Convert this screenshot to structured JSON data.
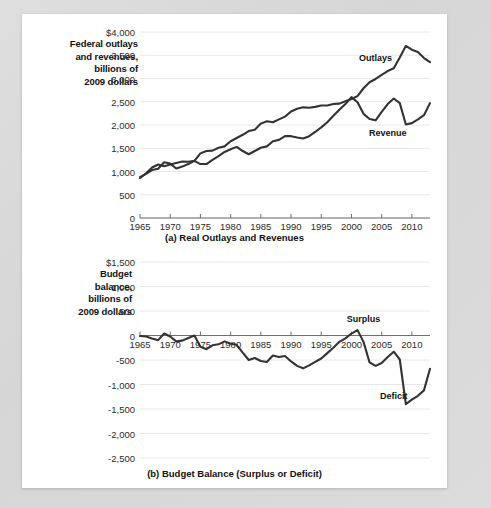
{
  "figure": {
    "background_color": "#d9d9d9",
    "card_color": "#ffffff",
    "line_color": "#333333"
  },
  "panel_a": {
    "axis_title": "Federal outlays and revenues, billions of 2009 dollars",
    "axis_title_lines": [
      "Federal outlays",
      "and revenues,",
      "billions of",
      "2009 dollars"
    ],
    "caption": "(a) Real Outlays and Revenues",
    "series_labels": [
      {
        "name": "outlays-label",
        "text": "Outlays"
      },
      {
        "name": "revenue-label",
        "text": "Revenue"
      }
    ]
  },
  "panel_b": {
    "axis_title": "Budget balance, billions of 2009 dollars",
    "axis_title_lines": [
      "Budget",
      "balance,",
      "billions of",
      "2009 dollars"
    ],
    "caption": "(b) Budget Balance (Surplus or Deficit)",
    "series_labels": [
      {
        "name": "surplus-label",
        "text": "Surplus"
      },
      {
        "name": "deficit-label",
        "text": "Deficit"
      }
    ]
  },
  "chart_data": [
    {
      "id": "real-outlays-and-revenues",
      "type": "line",
      "title": "(a) Real Outlays and Revenues",
      "xlabel": "",
      "ylabel": "Federal outlays and revenues, billions of 2009 dollars",
      "xlim": [
        1965,
        2013
      ],
      "ylim": [
        0,
        4000
      ],
      "grid": true,
      "yticks": [
        0,
        500,
        1000,
        1500,
        2000,
        2500,
        3000,
        3500,
        4000
      ],
      "ytick_labels": [
        "0",
        "500",
        "1,000",
        "1,500",
        "2,000",
        "2,500",
        "3,000",
        "3,500",
        "$4,000"
      ],
      "xticks": [
        1965,
        1970,
        1975,
        1980,
        1985,
        1990,
        1995,
        2000,
        2005,
        2010
      ],
      "xtick_labels": [
        "1965",
        "1970",
        "1975",
        "1980",
        "1985",
        "1990",
        "1995",
        "2000",
        "2005",
        "2010"
      ],
      "x": [
        1965,
        1966,
        1967,
        1968,
        1969,
        1970,
        1971,
        1972,
        1973,
        1974,
        1975,
        1976,
        1977,
        1978,
        1979,
        1980,
        1981,
        1982,
        1983,
        1984,
        1985,
        1986,
        1987,
        1988,
        1989,
        1990,
        1991,
        1992,
        1993,
        1994,
        1995,
        1996,
        1997,
        1998,
        1999,
        2000,
        2001,
        2002,
        2003,
        2004,
        2005,
        2006,
        2007,
        2008,
        2009,
        2010,
        2011,
        2012,
        2013
      ],
      "series": [
        {
          "name": "Outlays",
          "values": [
            860,
            960,
            1085,
            1150,
            1115,
            1150,
            1185,
            1215,
            1210,
            1230,
            1390,
            1440,
            1450,
            1510,
            1540,
            1650,
            1720,
            1790,
            1870,
            1900,
            2030,
            2080,
            2060,
            2120,
            2180,
            2290,
            2350,
            2380,
            2370,
            2390,
            2420,
            2420,
            2450,
            2460,
            2510,
            2560,
            2620,
            2790,
            2920,
            2990,
            3080,
            3160,
            3220,
            3450,
            3700,
            3620,
            3570,
            3440,
            3350
          ]
        },
        {
          "name": "Revenue",
          "values": [
            880,
            950,
            1030,
            1060,
            1200,
            1170,
            1065,
            1105,
            1160,
            1230,
            1160,
            1160,
            1250,
            1330,
            1420,
            1480,
            1530,
            1440,
            1370,
            1440,
            1510,
            1540,
            1650,
            1680,
            1760,
            1760,
            1730,
            1710,
            1760,
            1850,
            1950,
            2060,
            2200,
            2330,
            2450,
            2600,
            2490,
            2240,
            2130,
            2100,
            2280,
            2450,
            2570,
            2470,
            2010,
            2040,
            2120,
            2210,
            2470
          ]
        }
      ],
      "annotations": [
        {
          "text": "Outlays",
          "x": 2004,
          "y": 3440
        },
        {
          "text": "Revenue",
          "x": 2006,
          "y": 1820
        }
      ]
    },
    {
      "id": "budget-balance",
      "type": "line",
      "title": "(b) Budget Balance (Surplus or Deficit)",
      "xlabel": "",
      "ylabel": "Budget balance, billions of 2009 dollars",
      "xlim": [
        1965,
        2013
      ],
      "ylim": [
        -2500,
        1500
      ],
      "grid": true,
      "zero_line": true,
      "yticks": [
        1500,
        1000,
        500,
        0,
        -500,
        -1000,
        -1500,
        -2000,
        -2500
      ],
      "ytick_labels": [
        "$1,500",
        "1,000",
        "500",
        "0",
        "-500",
        "-1,000",
        "-1,500",
        "-2,000",
        "-2,500"
      ],
      "xticks": [
        1965,
        1970,
        1975,
        1980,
        1985,
        1990,
        1995,
        2000,
        2005,
        2010
      ],
      "xtick_labels": [
        "1965",
        "1970",
        "1975",
        "1980",
        "1985",
        "1990",
        "1995",
        "2000",
        "2005",
        "2010"
      ],
      "x": [
        1965,
        1966,
        1967,
        1968,
        1969,
        1970,
        1971,
        1972,
        1973,
        1974,
        1975,
        1976,
        1977,
        1978,
        1979,
        1980,
        1981,
        1982,
        1983,
        1984,
        1985,
        1986,
        1987,
        1988,
        1989,
        1990,
        1991,
        1992,
        1993,
        1994,
        1995,
        1996,
        1997,
        1998,
        1999,
        2000,
        2001,
        2002,
        2003,
        2004,
        2005,
        2006,
        2007,
        2008,
        2009,
        2010,
        2011,
        2012,
        2013
      ],
      "series": [
        {
          "name": "Budget balance",
          "values": [
            -10,
            -20,
            -60,
            -95,
            40,
            -20,
            -120,
            -105,
            -50,
            0,
            -230,
            -280,
            -200,
            -180,
            -120,
            -170,
            -190,
            -350,
            -500,
            -460,
            -520,
            -540,
            -410,
            -440,
            -420,
            -530,
            -620,
            -670,
            -610,
            -540,
            -470,
            -360,
            -250,
            -130,
            -60,
            40,
            110,
            -130,
            -550,
            -620,
            -560,
            -440,
            -330,
            -490,
            -1400,
            -1310,
            -1230,
            -1120,
            -680
          ]
        }
      ],
      "annotations": [
        {
          "text": "Surplus",
          "x": 2002,
          "y": 330
        },
        {
          "text": "Deficit",
          "x": 2007,
          "y": -1230
        }
      ]
    }
  ]
}
